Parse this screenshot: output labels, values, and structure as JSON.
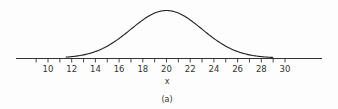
{
  "chart_data": {
    "type": "line",
    "title": "",
    "caption": "(a)",
    "xlabel": "x",
    "ylabel": "",
    "xlim": [
      7,
      33
    ],
    "x_ticks": [
      10,
      12,
      14,
      16,
      18,
      20,
      22,
      24,
      26,
      28,
      30
    ],
    "minor_tick_step": 1,
    "grid": false,
    "legend": null,
    "series": [
      {
        "name": "normal density curve",
        "distribution": "normal",
        "mean": 20,
        "std_dev": 3,
        "support_shown": [
          11.5,
          29
        ],
        "x": [
          11.5,
          12,
          13,
          14,
          15,
          16,
          17,
          18,
          19,
          20,
          21,
          22,
          23,
          24,
          25,
          26,
          27,
          28,
          29
        ],
        "relative_height": [
          0.02,
          0.03,
          0.07,
          0.14,
          0.25,
          0.41,
          0.61,
          0.8,
          0.95,
          1.0,
          0.95,
          0.8,
          0.61,
          0.41,
          0.25,
          0.14,
          0.07,
          0.03,
          0.01
        ]
      }
    ],
    "colors": {
      "line": "#222222",
      "axis": "#333333"
    }
  }
}
